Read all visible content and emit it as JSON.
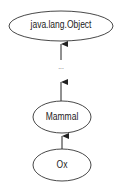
{
  "diagram": {
    "nodes": [
      {
        "id": "object",
        "label": "java.lang.Object"
      },
      {
        "id": "ellipsis",
        "label": "..."
      },
      {
        "id": "mammal",
        "label": "Mammal"
      },
      {
        "id": "ox",
        "label": "Ox"
      }
    ],
    "edges": [
      {
        "from": "ox",
        "to": "mammal"
      },
      {
        "from": "mammal",
        "to": "ellipsis"
      },
      {
        "from": "ellipsis",
        "to": "object"
      }
    ],
    "colors": {
      "stroke": "#222222",
      "background": "#ffffff"
    }
  }
}
